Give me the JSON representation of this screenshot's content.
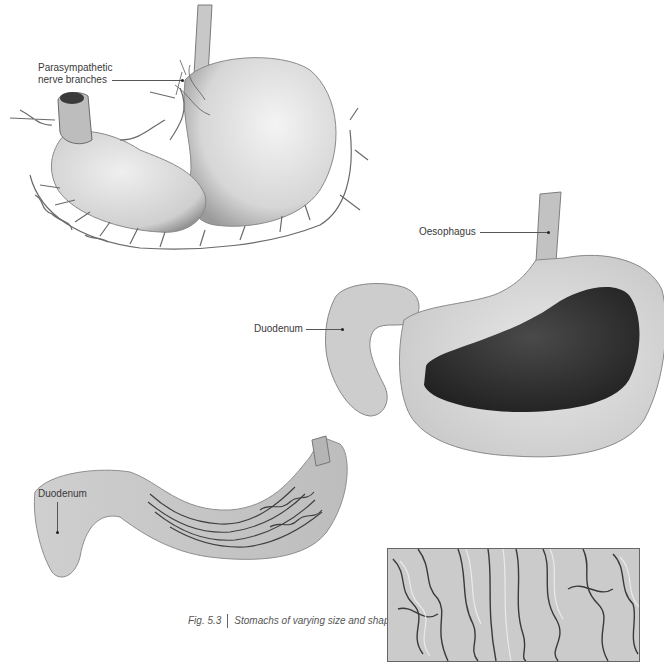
{
  "figure": {
    "number": "Fig. 5.3",
    "caption": "Stomachs of varying size and shape"
  },
  "specimens": [
    {
      "id": "stomach-top",
      "labels": [
        {
          "text_line1": "Parasympathetic",
          "text_line2": "nerve branches"
        }
      ]
    },
    {
      "id": "stomach-middle",
      "labels": [
        {
          "text": "Oesophagus"
        },
        {
          "text": "Duodenum"
        }
      ]
    },
    {
      "id": "stomach-bottom",
      "labels": [
        {
          "text": "Duodenum"
        }
      ]
    }
  ],
  "inset": {
    "description": "Close-up of gastric mucosal folds (rugae)"
  },
  "colors": {
    "background": "#ffffff",
    "specimen_light": "#e6e6e6",
    "specimen_mid": "#bdbdbd",
    "specimen_dark": "#3a3a3a",
    "label_text": "#3a3a3a"
  }
}
